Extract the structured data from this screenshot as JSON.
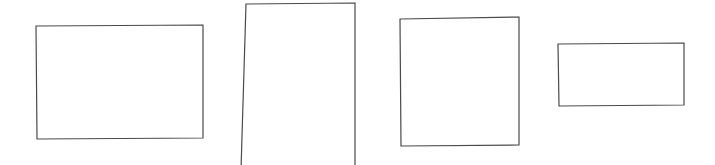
{
  "canvas": {
    "width": 715,
    "height": 165,
    "background_color": "#ffffff",
    "title": "Four outlined rectangles"
  },
  "style": {
    "stroke_color": "#4a4a4a",
    "fill_color": "#ffffff",
    "stroke_width": 1.2
  },
  "shapes": [
    {
      "name": "rectangle-1",
      "label": "Rectangle 1",
      "x": 36,
      "y": 25,
      "width": 167,
      "height": 114,
      "clipped": false,
      "points": "36,26 203,25 203,138 37,139"
    },
    {
      "name": "rectangle-2",
      "label": "Rectangle 2",
      "x": 241,
      "y": 3,
      "width": 114,
      "height": 162,
      "clipped": true,
      "points": "246,4 355,3 355,170 241,170"
    },
    {
      "name": "rectangle-3",
      "label": "Rectangle 3",
      "x": 400,
      "y": 17,
      "width": 119,
      "height": 129,
      "clipped": false,
      "points": "400,19 519,17 519,145 401,146"
    },
    {
      "name": "rectangle-4",
      "label": "Rectangle 4",
      "x": 558,
      "y": 43,
      "width": 126,
      "height": 63,
      "clipped": false,
      "points": "558,44 684,43 684,105 559,106"
    }
  ]
}
